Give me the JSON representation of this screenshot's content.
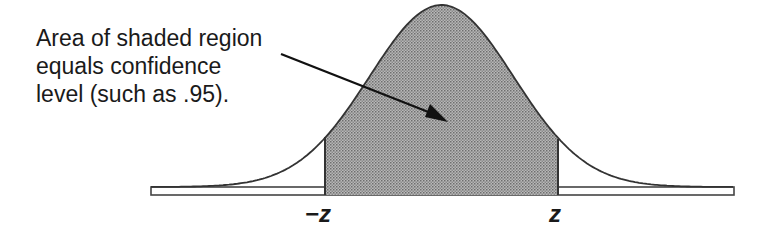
{
  "annotation": {
    "lines": [
      "Area of shaded region",
      "equals confidence",
      "level (such as .95)."
    ]
  },
  "labels": {
    "left_critical": "−z",
    "right_critical": "z"
  },
  "curve": {
    "type": "normal-density",
    "shaded_region": "between -z and z",
    "confidence_level_example": ".95"
  },
  "colors": {
    "stroke": "#333333",
    "shade": "#9a9a9a",
    "text": "#1a1a1a"
  }
}
